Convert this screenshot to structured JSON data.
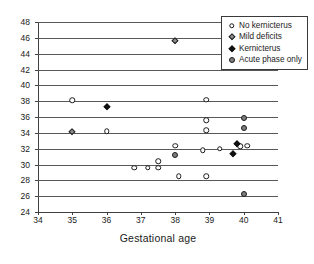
{
  "chart_data": {
    "type": "scatter",
    "title": "",
    "xlabel": "Gestational age",
    "ylabel": "",
    "xlim": [
      34,
      41
    ],
    "ylim": [
      24,
      48
    ],
    "xticks": [
      34,
      35,
      36,
      37,
      38,
      39,
      40,
      41
    ],
    "yticks": [
      24,
      26,
      28,
      30,
      32,
      34,
      36,
      38,
      40,
      42,
      44,
      46,
      48
    ],
    "grid": "horizontal",
    "legend_position": "top-right",
    "series": [
      {
        "name": "No kernicterus",
        "marker": "open-circle",
        "color": "#ffffff",
        "edge_color": "#1b1b1b",
        "points": [
          {
            "x": 35.0,
            "y": 38.1
          },
          {
            "x": 36.0,
            "y": 34.2
          },
          {
            "x": 37.5,
            "y": 30.4
          },
          {
            "x": 36.8,
            "y": 29.6
          },
          {
            "x": 37.2,
            "y": 29.6
          },
          {
            "x": 37.5,
            "y": 29.6
          },
          {
            "x": 38.0,
            "y": 32.4
          },
          {
            "x": 38.1,
            "y": 28.5
          },
          {
            "x": 38.9,
            "y": 38.2
          },
          {
            "x": 38.9,
            "y": 35.6
          },
          {
            "x": 38.9,
            "y": 34.3
          },
          {
            "x": 38.8,
            "y": 31.8
          },
          {
            "x": 38.9,
            "y": 28.5
          },
          {
            "x": 39.3,
            "y": 32.0
          },
          {
            "x": 39.9,
            "y": 32.3
          },
          {
            "x": 40.1,
            "y": 32.4
          }
        ]
      },
      {
        "name": "Mild deficits",
        "marker": "gray-diamond",
        "color": "#8f8f8f",
        "edge_color": "#1b1b1b",
        "points": [
          {
            "x": 38.0,
            "y": 45.6
          },
          {
            "x": 35.0,
            "y": 34.1
          }
        ]
      },
      {
        "name": "Kernicterus",
        "marker": "black-diamond",
        "color": "#111111",
        "edge_color": "#111111",
        "points": [
          {
            "x": 36.0,
            "y": 37.3
          },
          {
            "x": 39.8,
            "y": 32.6
          },
          {
            "x": 39.7,
            "y": 31.3
          }
        ]
      },
      {
        "name": "Acute phase only",
        "marker": "gray-circle",
        "color": "#7d7d7d",
        "edge_color": "#1b1b1b",
        "points": [
          {
            "x": 40.0,
            "y": 35.9
          },
          {
            "x": 40.0,
            "y": 34.6
          },
          {
            "x": 38.0,
            "y": 31.2
          },
          {
            "x": 40.0,
            "y": 26.3
          }
        ]
      }
    ]
  },
  "legend": {
    "items": [
      {
        "label": "No kernicterus",
        "marker": "open-circle"
      },
      {
        "label": "Mild deficits",
        "marker": "gray-diamond"
      },
      {
        "label": "Kernicterus",
        "marker": "black-diamond"
      },
      {
        "label": "Acute phase only",
        "marker": "gray-circle"
      }
    ]
  }
}
